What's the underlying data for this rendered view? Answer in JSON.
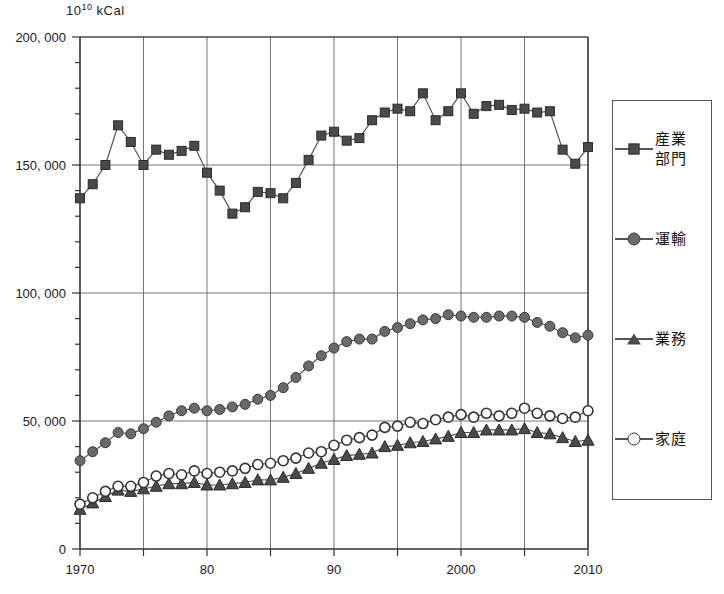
{
  "chart_data": {
    "type": "line",
    "title": "",
    "subtitle": "",
    "unit_label_mantissa": "10",
    "unit_label_exponent": "10",
    "unit_label_suffix": "kCal",
    "xlabel": "",
    "ylabel": "10^10 kCal",
    "xlim": [
      1970,
      2010
    ],
    "ylim": [
      0,
      200000
    ],
    "grid": true,
    "legend_position": "right",
    "xticks": [
      1970,
      1980,
      1990,
      2000,
      2010
    ],
    "xtick_labels": [
      "1970",
      "80",
      "90",
      "2000",
      "2010"
    ],
    "xminor_gridlines": [
      1975,
      1980,
      1985,
      1990,
      1995,
      2000,
      2005
    ],
    "yticks": [
      0,
      50000,
      100000,
      150000,
      200000
    ],
    "ytick_labels": [
      "0",
      "50, 000",
      "100, 000",
      "150, 000",
      "200, 000"
    ],
    "yminor_tick_step": 10000,
    "x": [
      1970,
      1971,
      1972,
      1973,
      1974,
      1975,
      1976,
      1977,
      1978,
      1979,
      1980,
      1981,
      1982,
      1983,
      1984,
      1985,
      1986,
      1987,
      1988,
      1989,
      1990,
      1991,
      1992,
      1993,
      1994,
      1995,
      1996,
      1997,
      1998,
      1999,
      2000,
      2001,
      2002,
      2003,
      2004,
      2005,
      2006,
      2007,
      2008,
      2009,
      2010
    ],
    "series": [
      {
        "name": "産業部門",
        "marker": "filled-square",
        "color": "#4a4a4a",
        "values": [
          137000,
          142500,
          150000,
          165500,
          159000,
          150000,
          156000,
          154000,
          155500,
          157500,
          147000,
          140000,
          131000,
          133500,
          139500,
          139000,
          137000,
          143000,
          152000,
          161500,
          163000,
          159500,
          160500,
          167500,
          170500,
          172000,
          171000,
          178000,
          167500,
          171000,
          178000,
          170000,
          173000,
          173500,
          171500,
          172000,
          170500,
          171000,
          156000,
          150500,
          157000
        ]
      },
      {
        "name": "運輸",
        "marker": "filled-circle",
        "color": "#6a6a6a",
        "values": [
          34500,
          38000,
          41500,
          45500,
          45000,
          47000,
          49500,
          52000,
          54000,
          55000,
          54000,
          54500,
          55500,
          56500,
          58500,
          60000,
          63000,
          67000,
          71500,
          75500,
          78500,
          81000,
          82000,
          82000,
          85000,
          86500,
          88000,
          89500,
          90000,
          91500,
          91000,
          90500,
          90500,
          91000,
          91000,
          90500,
          88500,
          87000,
          84500,
          82500,
          83500
        ]
      },
      {
        "name": "業務",
        "marker": "filled-triangle",
        "color": "#4a4a4a",
        "values": [
          15500,
          18000,
          20500,
          23000,
          22500,
          23500,
          24500,
          25500,
          25500,
          26000,
          25000,
          25000,
          25500,
          26000,
          27000,
          27000,
          28000,
          29500,
          31500,
          33500,
          35000,
          36500,
          37000,
          37500,
          40000,
          40500,
          41500,
          42000,
          43000,
          44000,
          45500,
          45500,
          46500,
          46500,
          46500,
          47000,
          45500,
          45000,
          43500,
          42000,
          42500
        ]
      },
      {
        "name": "家庭",
        "marker": "open-circle",
        "color": "#333333",
        "values": [
          17500,
          20000,
          22500,
          24500,
          24500,
          26000,
          28500,
          29500,
          29000,
          30500,
          29500,
          30000,
          30500,
          31500,
          33000,
          33500,
          34500,
          35500,
          37500,
          38000,
          40500,
          42500,
          43500,
          44500,
          47500,
          48000,
          49500,
          49000,
          50500,
          51500,
          52500,
          51500,
          53000,
          52000,
          53000,
          55000,
          53000,
          52000,
          51000,
          51500,
          54000
        ]
      }
    ]
  },
  "legend": {
    "items": [
      {
        "label": "産業\n部門",
        "marker": "filled-square"
      },
      {
        "label": "運輸",
        "marker": "filled-circle"
      },
      {
        "label": "業務",
        "marker": "filled-triangle"
      },
      {
        "label": "家庭",
        "marker": "open-circle"
      }
    ]
  }
}
